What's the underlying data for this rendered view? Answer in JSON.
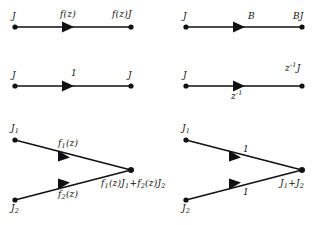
{
  "figure": {
    "type": "signal-flow-graph",
    "background_color": "#ffffff",
    "stroke_color": "#111111",
    "node_color": "#111111",
    "panel_count": 4
  },
  "panels": [
    {
      "id": "branch-transmittance-f",
      "row": 1,
      "column": 1,
      "description": "single directed branch with transmittance f(z)",
      "source_label": "J",
      "branch_label": "f(z)",
      "branch_label_position": "above",
      "sink_label": "f(z)J",
      "nodes": [
        {
          "name": "source-node",
          "x": 15,
          "y": 27
        },
        {
          "name": "sink-node",
          "x": 131,
          "y": 27
        }
      ],
      "arrow": {
        "x": 70,
        "y": 27,
        "direction": "right"
      }
    },
    {
      "id": "branch-transmittance-B",
      "row": 1,
      "column": 2,
      "description": "single directed branch with constant transmittance B",
      "source_label": "J",
      "branch_label": "B",
      "branch_label_position": "above",
      "sink_label": "BJ",
      "nodes": [
        {
          "name": "source-node",
          "x": 186,
          "y": 27
        },
        {
          "name": "sink-node",
          "x": 302,
          "y": 27
        }
      ],
      "arrow": {
        "x": 241,
        "y": 27,
        "direction": "right"
      }
    },
    {
      "id": "branch-transmittance-unity",
      "row": 2,
      "column": 1,
      "description": "single directed branch with unity transmittance",
      "source_label": "J",
      "branch_label": "1",
      "branch_label_position": "above",
      "sink_label": "J",
      "nodes": [
        {
          "name": "source-node",
          "x": 15,
          "y": 86
        },
        {
          "name": "sink-node",
          "x": 131,
          "y": 86
        }
      ],
      "arrow": {
        "x": 70,
        "y": 86,
        "direction": "right"
      }
    },
    {
      "id": "branch-transmittance-unit-delay",
      "row": 2,
      "column": 2,
      "description": "single directed branch with unit delay transmittance",
      "source_label": "J",
      "branch_label_base": "z",
      "branch_label_exponent": "-1",
      "branch_label_position": "below",
      "sink_label_base": "z",
      "sink_label_exponent": "-1",
      "sink_label_operand": "J",
      "nodes": [
        {
          "name": "source-node",
          "x": 186,
          "y": 86
        },
        {
          "name": "sink-node",
          "x": 302,
          "y": 86
        }
      ],
      "arrow": {
        "x": 241,
        "y": 86,
        "direction": "right"
      }
    },
    {
      "id": "summing-node-weighted",
      "row": 3,
      "column": 1,
      "description": "two branches with transmittances f1(z) and f2(z) converging on a summing node",
      "source_label_1": "J",
      "source_sub_1": "1",
      "source_label_2": "J",
      "source_sub_2": "2",
      "branch_label_1": "f",
      "branch_sub_1": "1",
      "branch_suffix_1": "(z)",
      "branch_label_2": "f",
      "branch_sub_2": "2",
      "branch_suffix_2": "(z)",
      "sum_label": "f₁(z)J₁+f₂(z)J₂",
      "nodes": [
        {
          "name": "source-node-1",
          "x": 15,
          "y": 140
        },
        {
          "name": "source-node-2",
          "x": 15,
          "y": 200
        },
        {
          "name": "sum-node",
          "x": 131,
          "y": 170
        }
      ],
      "arrows": [
        {
          "x": 66,
          "y": 162,
          "direction": "down-right"
        },
        {
          "x": 66,
          "y": 185,
          "direction": "up-right"
        }
      ]
    },
    {
      "id": "summing-node-unity",
      "row": 3,
      "column": 2,
      "description": "two unity branches converging on a summing node producing the sum",
      "source_label_1": "J",
      "source_sub_1": "1",
      "source_label_2": "J",
      "source_sub_2": "2",
      "branch_label_1": "1",
      "branch_label_2": "1",
      "sum_label": "J₁+J₂",
      "nodes": [
        {
          "name": "source-node-1",
          "x": 186,
          "y": 140
        },
        {
          "name": "source-node-2",
          "x": 186,
          "y": 200
        },
        {
          "name": "sum-node",
          "x": 302,
          "y": 170
        }
      ],
      "arrows": [
        {
          "x": 237,
          "y": 162,
          "direction": "down-right"
        },
        {
          "x": 237,
          "y": 185,
          "direction": "up-right"
        }
      ]
    }
  ],
  "labels": {
    "p1_source": "J",
    "p1_branch": "f(z)",
    "p1_sink": "f(z)J",
    "p2_source": "J",
    "p2_branch": "B",
    "p2_sink": "BJ",
    "p3_source": "J",
    "p3_branch": "1",
    "p3_sink": "J",
    "p4_source": "J",
    "p4_branch_base": "z",
    "p4_branch_exp": "-1",
    "p4_sink_base": "z",
    "p4_sink_exp": "-1",
    "p4_sink_operand": "J",
    "p5_src1_base": "J",
    "p5_src1_sub": "1",
    "p5_src2_base": "J",
    "p5_src2_sub": "2",
    "p5_br1_base": "f",
    "p5_br1_sub": "1",
    "p5_br1_tail": "(z)",
    "p5_br2_base": "f",
    "p5_br2_sub": "2",
    "p5_br2_tail": "(z)",
    "p5_sum_f1": "f",
    "p5_sum_f1_sub": "1",
    "p5_sum_f1_tail": "(z)J",
    "p5_sum_j1_sub": "1",
    "p5_sum_plus": "+",
    "p5_sum_f2": "f",
    "p5_sum_f2_sub": "2",
    "p5_sum_f2_tail": "(z)J",
    "p5_sum_j2_sub": "2",
    "p6_src1_base": "J",
    "p6_src1_sub": "1",
    "p6_src2_base": "J",
    "p6_src2_sub": "2",
    "p6_br1": "1",
    "p6_br2": "1",
    "p6_sum_base1": "J",
    "p6_sum_sub1": "1",
    "p6_sum_plus": "+",
    "p6_sum_base2": "J",
    "p6_sum_sub2": "2"
  }
}
